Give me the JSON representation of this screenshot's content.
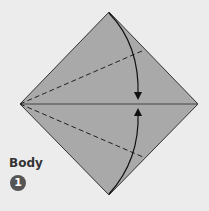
{
  "diagram": {
    "section_label": "Body",
    "step_number": "1",
    "colors": {
      "background": "#ececec",
      "paper": "#a9a9a9",
      "line": "#222222",
      "step_badge": "#555555"
    }
  }
}
